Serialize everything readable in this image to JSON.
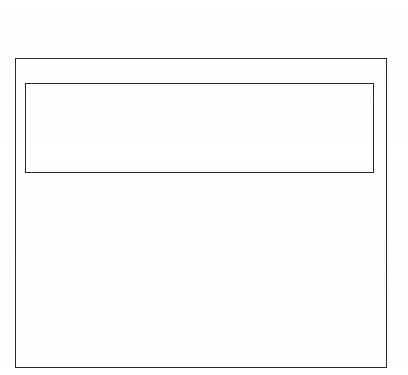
{
  "document": {
    "kind": "line-art-rectangle-diagram",
    "title": "",
    "background_color": "#fefefe",
    "line_color": "#2b2b2b",
    "canvas": {
      "width": 408,
      "height": 375
    }
  },
  "shapes": {
    "outer_frame": {
      "name": "outer rectangle",
      "label": "",
      "x": 15,
      "y": 58,
      "width": 372,
      "height": 310,
      "stroke_color": "#2b2b2b",
      "stroke_width": 1.6,
      "fill": "none"
    },
    "inner_banner": {
      "name": "inner banner rectangle",
      "label": "",
      "x": 26,
      "y": 84,
      "width": 349,
      "height": 90,
      "stroke_color": "#2b2b2b",
      "stroke_width": 1.7,
      "fill": "none"
    },
    "body_region": {
      "name": "lower empty region",
      "label": "",
      "x": 26,
      "y": 180,
      "width": 349,
      "height": 182,
      "fill": "none"
    }
  }
}
